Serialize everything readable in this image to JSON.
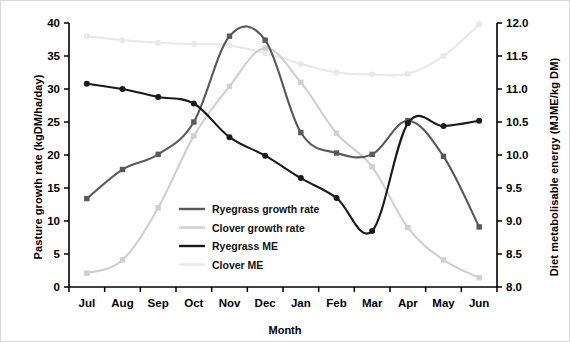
{
  "chart_data": {
    "type": "line",
    "title": "",
    "xlabel": "Month",
    "ylabel": "Pasture growth rate (kgDM/ha/day)",
    "ylabel_right": "Diet metabolisable energy (MJME/kg DM)",
    "categories": [
      "Jul",
      "Aug",
      "Sep",
      "Oct",
      "Nov",
      "Dec",
      "Jan",
      "Feb",
      "Mar",
      "Apr",
      "May",
      "Jun"
    ],
    "ylim": [
      0,
      40
    ],
    "yticks": [
      "0",
      "5",
      "10",
      "15",
      "20",
      "25",
      "30",
      "35",
      "40"
    ],
    "ylim_right": [
      8.0,
      12.0
    ],
    "yticks_right": [
      "8.0",
      "8.5",
      "9.0",
      "9.5",
      "10.0",
      "10.5",
      "11.0",
      "11.5",
      "12.0"
    ],
    "grid": false,
    "legend_position": "inside-lower-left",
    "series": [
      {
        "name": "Ryegrass growth rate",
        "axis": "left",
        "color": "#595959",
        "marker": "square",
        "values": [
          13.4,
          17.8,
          20.1,
          25.0,
          38.0,
          37.4,
          23.4,
          20.3,
          20.1,
          25.2,
          19.8,
          9.1
        ]
      },
      {
        "name": "Clover growth rate",
        "axis": "left",
        "color": "#cfcfcf",
        "marker": "square",
        "values": [
          2.1,
          4.1,
          12.0,
          22.9,
          30.4,
          36.2,
          31.0,
          23.3,
          18.2,
          9.0,
          4.1,
          1.4
        ]
      },
      {
        "name": "Ryegrass ME",
        "axis": "right",
        "color": "#1a1a1a",
        "marker": "circle",
        "values": [
          11.08,
          11.0,
          10.88,
          10.78,
          10.27,
          9.99,
          9.65,
          9.35,
          8.85,
          10.48,
          10.44,
          10.52
        ]
      },
      {
        "name": "Clover ME",
        "axis": "right",
        "color": "#e8e8e8",
        "marker": "circle",
        "values": [
          11.8,
          11.74,
          11.7,
          11.68,
          11.66,
          11.54,
          11.38,
          11.25,
          11.22,
          11.23,
          11.5,
          11.98
        ]
      }
    ]
  }
}
